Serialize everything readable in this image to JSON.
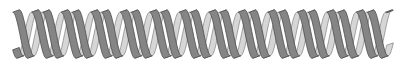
{
  "graphic": {
    "subject": "double-helix-icon",
    "x_start": 16,
    "x_end": 390,
    "center_y": 34,
    "amplitude": 23,
    "period": 29.5,
    "ribbon_width": 6,
    "colors": {
      "background": "#ffffff",
      "front_fill": "#858585",
      "front_outline": "#4a4a4a",
      "back_fill": "#d6d6d6",
      "back_outline": "#8a8a8a"
    }
  }
}
